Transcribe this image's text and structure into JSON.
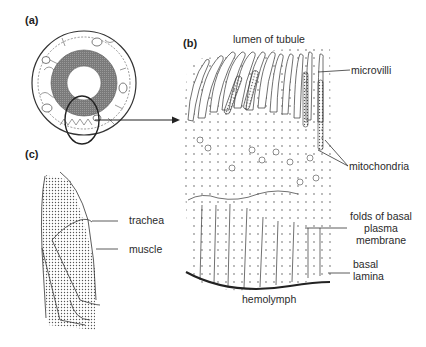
{
  "figure": {
    "panels": {
      "a": {
        "label": "(a)"
      },
      "b": {
        "label": "(b)"
      },
      "c": {
        "label": "(c)"
      }
    },
    "panel_b": {
      "top_label": "lumen of tubule",
      "bottom_label": "hemolymph",
      "callouts": {
        "microvilli": "microvilli",
        "mitochondria": "mitochondria",
        "folds_line1": "folds of basal",
        "folds_line2": "plasma",
        "folds_line3": "membrane",
        "basal_line1": "basal",
        "basal_line2": "lamina"
      }
    },
    "panel_c": {
      "callouts": {
        "trachea": "trachea",
        "muscle": "muscle"
      }
    },
    "colors": {
      "ink": "#2a2a2a",
      "ring_dark": "#6e6e6e",
      "stipple": "#555555",
      "background": "#ffffff"
    }
  }
}
